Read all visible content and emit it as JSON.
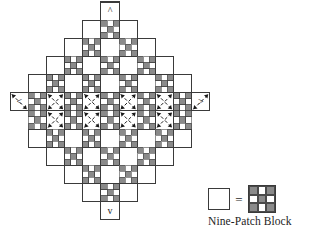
{
  "figure": {
    "title": "Nine-Patch Block",
    "colors": {
      "patch_gray": "#8a8a8a",
      "patch_white": "#ffffff",
      "outline": "#3a3a3a",
      "dash_line": "#1a1a1a",
      "background": "#ffffff",
      "text": "#1d1d1d"
    }
  },
  "diagram": {
    "name": "diagonal-set-quilt-layout",
    "cell_size": 6.05,
    "block_size": 18.15,
    "origin_x": 10.2,
    "origin_y": 2.0,
    "grid_columns": 12,
    "grid_rows": 12,
    "block_pattern": {
      "name": "nine-patch",
      "rows": 3,
      "cols": 3,
      "cells": [
        [
          "gray",
          "white",
          "gray"
        ],
        [
          "white",
          "gray",
          "white"
        ],
        [
          "gray",
          "white",
          "gray"
        ]
      ]
    },
    "plain_block": {
      "name": "plain-setting-block",
      "fill": "white"
    },
    "layout_rows": [
      {
        "row": 0,
        "blocks": [
          {
            "col": 5,
            "type": "plain"
          }
        ]
      },
      {
        "row": 1,
        "blocks": [
          {
            "col": 4,
            "type": "plain"
          },
          {
            "col": 5,
            "type": "nine-patch"
          },
          {
            "col": 6,
            "type": "plain"
          }
        ]
      },
      {
        "row": 2,
        "blocks": [
          {
            "col": 3,
            "type": "plain"
          },
          {
            "col": 4,
            "type": "nine-patch"
          },
          {
            "col": 5,
            "type": "plain"
          },
          {
            "col": 6,
            "type": "nine-patch"
          },
          {
            "col": 7,
            "type": "plain"
          }
        ]
      },
      {
        "row": 3,
        "blocks": [
          {
            "col": 2,
            "type": "plain"
          },
          {
            "col": 3,
            "type": "nine-patch"
          },
          {
            "col": 4,
            "type": "plain"
          },
          {
            "col": 5,
            "type": "nine-patch"
          },
          {
            "col": 6,
            "type": "plain"
          },
          {
            "col": 7,
            "type": "nine-patch"
          },
          {
            "col": 8,
            "type": "plain"
          }
        ]
      },
      {
        "row": 4,
        "blocks": [
          {
            "col": 1,
            "type": "plain"
          },
          {
            "col": 2,
            "type": "nine-patch"
          },
          {
            "col": 3,
            "type": "plain"
          },
          {
            "col": 4,
            "type": "nine-patch"
          },
          {
            "col": 5,
            "type": "plain"
          },
          {
            "col": 6,
            "type": "nine-patch"
          },
          {
            "col": 7,
            "type": "plain"
          },
          {
            "col": 8,
            "type": "nine-patch"
          },
          {
            "col": 9,
            "type": "plain"
          }
        ]
      },
      {
        "row": 5,
        "blocks": [
          {
            "col": 0,
            "type": "plain"
          },
          {
            "col": 1,
            "type": "nine-patch"
          },
          {
            "col": 2,
            "type": "plain"
          },
          {
            "col": 3,
            "type": "nine-patch"
          },
          {
            "col": 4,
            "type": "plain"
          },
          {
            "col": 5,
            "type": "nine-patch"
          },
          {
            "col": 6,
            "type": "plain"
          },
          {
            "col": 7,
            "type": "nine-patch"
          },
          {
            "col": 8,
            "type": "plain"
          },
          {
            "col": 9,
            "type": "nine-patch"
          },
          {
            "col": 10,
            "type": "plain"
          }
        ]
      },
      {
        "row": 6,
        "blocks": [
          {
            "col": 1,
            "type": "nine-patch"
          },
          {
            "col": 2,
            "type": "plain"
          },
          {
            "col": 3,
            "type": "nine-patch"
          },
          {
            "col": 4,
            "type": "plain"
          },
          {
            "col": 5,
            "type": "nine-patch"
          },
          {
            "col": 6,
            "type": "plain"
          },
          {
            "col": 7,
            "type": "nine-patch"
          },
          {
            "col": 8,
            "type": "plain"
          },
          {
            "col": 9,
            "type": "nine-patch"
          }
        ]
      },
      {
        "row": 7,
        "blocks": [
          {
            "col": 1,
            "type": "plain"
          },
          {
            "col": 2,
            "type": "nine-patch"
          },
          {
            "col": 3,
            "type": "plain"
          },
          {
            "col": 4,
            "type": "nine-patch"
          },
          {
            "col": 5,
            "type": "plain"
          },
          {
            "col": 6,
            "type": "nine-patch"
          },
          {
            "col": 7,
            "type": "plain"
          },
          {
            "col": 8,
            "type": "nine-patch"
          },
          {
            "col": 9,
            "type": "plain"
          }
        ]
      },
      {
        "row": 8,
        "blocks": [
          {
            "col": 2,
            "type": "plain"
          },
          {
            "col": 3,
            "type": "nine-patch"
          },
          {
            "col": 4,
            "type": "plain"
          },
          {
            "col": 5,
            "type": "nine-patch"
          },
          {
            "col": 6,
            "type": "plain"
          },
          {
            "col": 7,
            "type": "nine-patch"
          },
          {
            "col": 8,
            "type": "plain"
          }
        ]
      },
      {
        "row": 9,
        "blocks": [
          {
            "col": 3,
            "type": "plain"
          },
          {
            "col": 4,
            "type": "nine-patch"
          },
          {
            "col": 5,
            "type": "plain"
          },
          {
            "col": 6,
            "type": "nine-patch"
          },
          {
            "col": 7,
            "type": "plain"
          }
        ]
      },
      {
        "row": 10,
        "blocks": [
          {
            "col": 4,
            "type": "plain"
          },
          {
            "col": 5,
            "type": "nine-patch"
          },
          {
            "col": 6,
            "type": "plain"
          }
        ]
      },
      {
        "row": 11,
        "blocks": [
          {
            "col": 5,
            "type": "plain"
          }
        ]
      }
    ],
    "arrow_markers": [
      {
        "name": "arrow-up-top",
        "glyph": "^",
        "col": 5,
        "row": 0,
        "direction": "up"
      },
      {
        "name": "arrow-left-west",
        "glyph": "<",
        "col": 0,
        "row": 5,
        "direction": "left"
      },
      {
        "name": "arrow-right-east",
        "glyph": ">",
        "col": 10,
        "row": 5,
        "direction": "right"
      },
      {
        "name": "arrow-down-bottom",
        "glyph": "v",
        "col": 5,
        "row": 11,
        "direction": "down"
      }
    ],
    "dashed_guides": {
      "name": "diagonal-assembly-guides",
      "style": "dashed",
      "arrowheads": "both-ends",
      "note": "dashed diagonal seam lines run through the plain setting blocks along the diamond edges"
    }
  },
  "legend": {
    "name": "nine-patch-legend",
    "equals_symbol": "=",
    "plain_label": "plain block",
    "caption": "Nine-Patch Block"
  }
}
